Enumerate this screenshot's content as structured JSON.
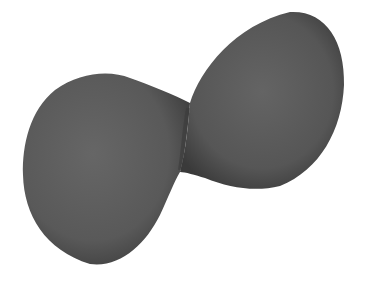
{
  "scene": {
    "description": "3D rendered gray dumbbell-shaped surface (two lobes joined at a narrow neck)",
    "background": "#ffffff",
    "colors": {
      "fill_light": "#6a6a6a",
      "fill_mid": "#5a5a5a",
      "fill_dark": "#3a3a3a"
    },
    "lobes": [
      {
        "name": "left-lobe",
        "bounds": {
          "x": 22,
          "y": 72,
          "w": 168,
          "h": 193
        }
      },
      {
        "name": "right-lobe",
        "bounds": {
          "x": 180,
          "y": 12,
          "w": 165,
          "h": 178
        }
      }
    ]
  }
}
